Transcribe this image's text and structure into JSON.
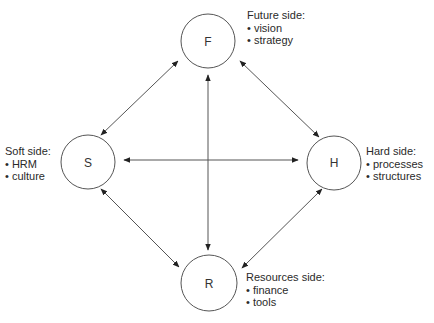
{
  "nodes": [
    {
      "id": "F",
      "letter": "F",
      "cx": 208,
      "cy": 41,
      "r": 27
    },
    {
      "id": "S",
      "letter": "S",
      "cx": 88,
      "cy": 162,
      "r": 27
    },
    {
      "id": "H",
      "letter": "H",
      "cx": 334,
      "cy": 163,
      "r": 27
    },
    {
      "id": "R",
      "letter": "R",
      "cx": 209,
      "cy": 283,
      "r": 28
    }
  ],
  "labels": {
    "future": {
      "title": "Future side:",
      "items": [
        "vision",
        "strategy"
      ]
    },
    "soft": {
      "title": "Soft side:",
      "items": [
        "HRM",
        "culture"
      ]
    },
    "hard": {
      "title": "Hard side:",
      "items": [
        "processes",
        "structures"
      ]
    },
    "resources": {
      "title": "Resources side:",
      "items": [
        "finance",
        "tools"
      ]
    }
  },
  "edges": [
    {
      "from": "S",
      "to": "F",
      "type": "bidirectional"
    },
    {
      "from": "F",
      "to": "H",
      "type": "bidirectional"
    },
    {
      "from": "S",
      "to": "R",
      "type": "bidirectional"
    },
    {
      "from": "H",
      "to": "R",
      "type": "bidirectional"
    },
    {
      "from": "S",
      "to": "H",
      "type": "bidirectional"
    },
    {
      "from": "F",
      "to": "R",
      "type": "bidirectional"
    }
  ],
  "colors": {
    "stroke": "#444444",
    "text": "#2a2a2a"
  }
}
